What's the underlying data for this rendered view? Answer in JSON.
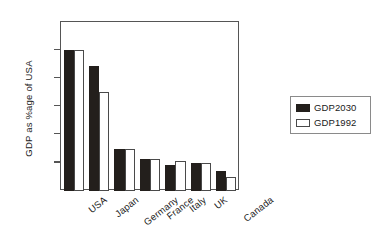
{
  "chart_data": {
    "type": "bar",
    "title": "",
    "xlabel": "",
    "ylabel": "GDP as %age of USA",
    "categories": [
      "USA",
      "Japan",
      "Germany",
      "France",
      "Italy",
      "UK",
      "Canada"
    ],
    "series": [
      {
        "name": "GDP2030",
        "color": "#231f1c",
        "style": "filled",
        "values": [
          1.0,
          0.89,
          0.3,
          0.23,
          0.185,
          0.2,
          0.145
        ]
      },
      {
        "name": "GDP1992",
        "color": "#ffffff",
        "style": "outlined",
        "values": [
          1.0,
          0.7,
          0.295,
          0.225,
          0.21,
          0.2,
          0.1
        ]
      }
    ],
    "ylim": [
      0,
      1.2
    ],
    "yticks": [
      0,
      0.2,
      0.4,
      0.6,
      0.8,
      1,
      1.2
    ],
    "ytick_labels": [
      "0",
      "0.2",
      "0.4",
      "0.6",
      "0.8",
      "1",
      "1.2"
    ],
    "grid": false,
    "legend_position": "right-outside",
    "xtick_rotation": -38
  },
  "axis": {
    "y_title": "GDP as %age of USA",
    "ticks": [
      {
        "value": 1.2,
        "label": "1.2"
      },
      {
        "value": 1.0,
        "label": "1"
      },
      {
        "value": 0.8,
        "label": "0.8"
      },
      {
        "value": 0.6,
        "label": "0.6"
      },
      {
        "value": 0.4,
        "label": "0.4"
      },
      {
        "value": 0.2,
        "label": "0.2"
      },
      {
        "value": 0.0,
        "label": "0"
      }
    ]
  },
  "legend": {
    "entries": [
      {
        "label": "GDP2030",
        "swatch": "dark"
      },
      {
        "label": "GDP1992",
        "swatch": "light"
      }
    ]
  }
}
